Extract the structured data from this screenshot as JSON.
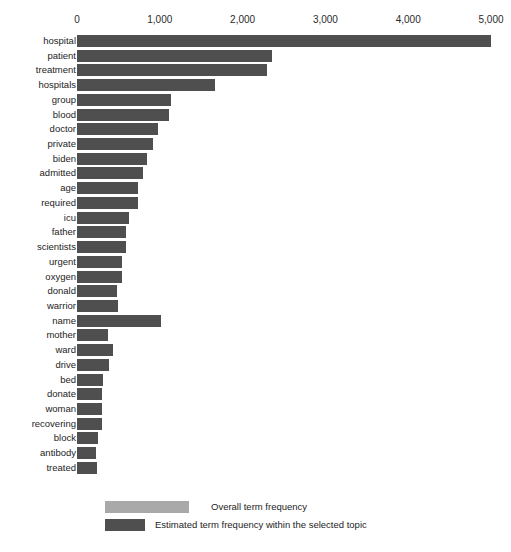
{
  "chart_data": {
    "type": "bar",
    "orientation": "horizontal",
    "title": "",
    "xlabel": "",
    "ylabel": "",
    "xlim": [
      0,
      5000
    ],
    "grid": false,
    "xticks": [
      "0",
      "1,000",
      "2,000",
      "3,000",
      "4,000",
      "5,000"
    ],
    "xtick_values": [
      0,
      1000,
      2000,
      3000,
      4000,
      5000
    ],
    "categories": [
      "hospital",
      "patient",
      "treatment",
      "hospitals",
      "group",
      "blood",
      "doctor",
      "private",
      "biden",
      "admitted",
      "age",
      "required",
      "icu",
      "father",
      "scientists",
      "urgent",
      "oxygen",
      "donald",
      "warrior",
      "name",
      "mother",
      "ward",
      "drive",
      "bed",
      "donate",
      "woman",
      "recovering",
      "block",
      "antibody",
      "treated"
    ],
    "series": [
      {
        "name": "Overall term frequency",
        "color": "#a9a9a9",
        "values": [
          5000,
          2360,
          2290,
          1670,
          1140,
          1110,
          980,
          920,
          840,
          800,
          740,
          740,
          630,
          590,
          590,
          545,
          545,
          485,
          500,
          1010,
          375,
          435,
          390,
          315,
          300,
          300,
          300,
          255,
          230,
          240
        ]
      },
      {
        "name": "Estimated term frequency within the selected topic",
        "color": "#4f4f4f",
        "values": [
          5000,
          2360,
          2290,
          1670,
          1140,
          1110,
          980,
          920,
          840,
          800,
          740,
          740,
          630,
          590,
          590,
          545,
          545,
          485,
          500,
          1010,
          375,
          435,
          390,
          315,
          300,
          300,
          300,
          255,
          230,
          240
        ]
      }
    ],
    "legend": {
      "position": "bottom",
      "entries": [
        {
          "label": "Overall term frequency",
          "color": "#a9a9a9"
        },
        {
          "label": "Estimated term frequency within the selected topic",
          "color": "#4f4f4f"
        }
      ]
    }
  }
}
